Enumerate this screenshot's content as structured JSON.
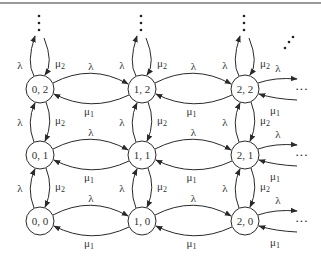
{
  "diagram": {
    "type": "state-transition",
    "title": "",
    "top_rule": true,
    "nodes": [
      {
        "id": "0,0",
        "label": "0, 0",
        "col": 0,
        "row": 0
      },
      {
        "id": "1,0",
        "label": "1, 0",
        "col": 1,
        "row": 0
      },
      {
        "id": "2,0",
        "label": "2, 0",
        "col": 2,
        "row": 0
      },
      {
        "id": "0,1",
        "label": "0, 1",
        "col": 0,
        "row": 1
      },
      {
        "id": "1,1",
        "label": "1, 1",
        "col": 1,
        "row": 1
      },
      {
        "id": "2,1",
        "label": "2, 1",
        "col": 2,
        "row": 1
      },
      {
        "id": "0,2",
        "label": "0, 2",
        "col": 0,
        "row": 2
      },
      {
        "id": "1,2",
        "label": "1, 2",
        "col": 1,
        "row": 2
      },
      {
        "id": "2,2",
        "label": "2, 2",
        "col": 2,
        "row": 2
      }
    ],
    "labels": {
      "lambda": "λ",
      "mu1": "μ",
      "mu1_sub": "1",
      "mu2": "μ",
      "mu2_sub": "2",
      "ellipsis_h": "···",
      "ellipsis_v": "⋮",
      "ellipsis_d": "⋰"
    },
    "edges_description": [
      "horizontal right: λ from (i,j) to (i+1,j)",
      "horizontal left: μ1 from (i+1,j) to (i,j)",
      "vertical up: λ from (i,j) to (i,j+1)",
      "vertical down: μ2 from (i,j+1) to (i,j)"
    ]
  }
}
